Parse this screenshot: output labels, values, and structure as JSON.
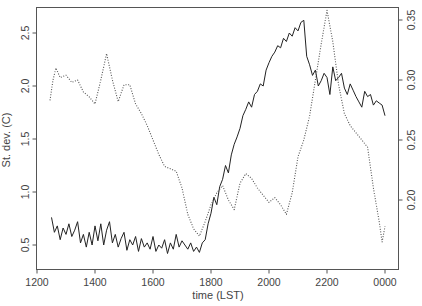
{
  "chart_data": {
    "type": "line",
    "title": "",
    "xlabel": "time (LST)",
    "ylabel": "St. dev. (C)",
    "ylabel_right": "",
    "x_tick_labels": [
      "1200",
      "1400",
      "1600",
      "1800",
      "2000",
      "2200",
      "0000"
    ],
    "y_ticks_left": [
      0.5,
      1.0,
      1.5,
      2.0,
      2.5
    ],
    "y_tick_labels_left": [
      "0.5",
      "1.0",
      "1.5",
      "2.0",
      "2.5"
    ],
    "y_ticks_right": [
      0.2,
      0.25,
      0.3,
      0.35
    ],
    "y_tick_labels_right": [
      "0.20",
      "0.25",
      "0.30",
      "0.35"
    ],
    "xlim_hours_after_noon": [
      0,
      12.45
    ],
    "ylim_left": [
      0.26,
      2.76
    ],
    "ylim_right": [
      0.143,
      0.361
    ],
    "grid": false,
    "legend": "none",
    "series": [
      {
        "name": "St. dev. (solid, left axis)",
        "style": "solid",
        "axis": "left",
        "x_hours": [
          0.5,
          0.6,
          0.7,
          0.8,
          0.9,
          1.0,
          1.1,
          1.2,
          1.3,
          1.4,
          1.5,
          1.6,
          1.7,
          1.8,
          1.9,
          2.0,
          2.1,
          2.2,
          2.3,
          2.4,
          2.5,
          2.6,
          2.7,
          2.8,
          2.9,
          3.0,
          3.1,
          3.2,
          3.3,
          3.4,
          3.5,
          3.6,
          3.7,
          3.8,
          3.9,
          4.0,
          4.1,
          4.2,
          4.3,
          4.4,
          4.5,
          4.6,
          4.7,
          4.8,
          4.9,
          5.0,
          5.1,
          5.2,
          5.3,
          5.4,
          5.5,
          5.6,
          5.7,
          5.8,
          5.9,
          6.0,
          6.1,
          6.2,
          6.3,
          6.4,
          6.5,
          6.6,
          6.7,
          6.8,
          6.9,
          7.0,
          7.1,
          7.2,
          7.3,
          7.4,
          7.5,
          7.6,
          7.7,
          7.8,
          7.9,
          8.0,
          8.1,
          8.2,
          8.3,
          8.4,
          8.5,
          8.6,
          8.7,
          8.8,
          8.9,
          9.0,
          9.1,
          9.2,
          9.3,
          9.4,
          9.5,
          9.6,
          9.7,
          9.8,
          9.9,
          10.0,
          10.1,
          10.2,
          10.3,
          10.4,
          10.5,
          10.6,
          10.7,
          10.8,
          10.9,
          11.0,
          11.1,
          11.2,
          11.3,
          11.4,
          11.5,
          11.6,
          11.7,
          11.8,
          11.9,
          12.0
        ],
        "values": [
          0.76,
          0.62,
          0.68,
          0.55,
          0.66,
          0.6,
          0.7,
          0.58,
          0.64,
          0.72,
          0.52,
          0.6,
          0.48,
          0.62,
          0.5,
          0.68,
          0.54,
          0.7,
          0.5,
          0.64,
          0.72,
          0.52,
          0.6,
          0.48,
          0.56,
          0.62,
          0.45,
          0.55,
          0.5,
          0.58,
          0.44,
          0.56,
          0.48,
          0.52,
          0.46,
          0.58,
          0.44,
          0.5,
          0.47,
          0.55,
          0.42,
          0.52,
          0.46,
          0.6,
          0.48,
          0.54,
          0.5,
          0.46,
          0.52,
          0.44,
          0.48,
          0.43,
          0.52,
          0.55,
          0.7,
          0.8,
          0.95,
          0.88,
          1.05,
          1.12,
          1.25,
          1.18,
          1.35,
          1.45,
          1.52,
          1.6,
          1.72,
          1.78,
          1.85,
          1.8,
          1.92,
          1.95,
          2.02,
          2.0,
          2.15,
          2.22,
          2.28,
          2.32,
          2.38,
          2.36,
          2.45,
          2.42,
          2.5,
          2.47,
          2.55,
          2.52,
          2.6,
          2.62,
          2.28,
          2.2,
          2.1,
          2.15,
          2.0,
          2.05,
          2.12,
          2.08,
          1.92,
          2.18,
          2.05,
          2.08,
          2.12,
          1.98,
          1.92,
          2.02,
          1.96,
          1.9,
          1.85,
          1.8,
          1.95,
          1.9,
          1.92,
          1.82,
          1.86,
          1.84,
          1.82,
          1.72
        ],
        "color": "#222222"
      },
      {
        "name": "Dotted series (right axis)",
        "style": "dotted",
        "axis": "right",
        "x_hours": [
          0.45,
          0.55,
          0.65,
          0.8,
          1.0,
          1.2,
          1.4,
          1.6,
          1.8,
          2.0,
          2.2,
          2.4,
          2.6,
          2.8,
          3.0,
          3.2,
          3.4,
          3.6,
          3.8,
          4.0,
          4.2,
          4.4,
          4.6,
          4.8,
          5.0,
          5.2,
          5.4,
          5.6,
          5.8,
          6.0,
          6.2,
          6.4,
          6.6,
          6.8,
          7.0,
          7.2,
          7.4,
          7.6,
          7.8,
          8.0,
          8.2,
          8.4,
          8.6,
          8.8,
          9.0,
          9.2,
          9.4,
          9.6,
          9.8,
          10.0,
          10.2,
          10.4,
          10.6,
          10.8,
          11.0,
          11.2,
          11.4,
          11.6,
          11.8,
          11.9,
          12.0
        ],
        "values": [
          0.283,
          0.3,
          0.31,
          0.302,
          0.304,
          0.298,
          0.3,
          0.29,
          0.286,
          0.28,
          0.3,
          0.322,
          0.3,
          0.282,
          0.296,
          0.296,
          0.28,
          0.272,
          0.262,
          0.25,
          0.238,
          0.228,
          0.226,
          0.224,
          0.21,
          0.188,
          0.176,
          0.17,
          0.182,
          0.196,
          0.206,
          0.212,
          0.2,
          0.192,
          0.214,
          0.222,
          0.218,
          0.21,
          0.204,
          0.198,
          0.202,
          0.196,
          0.188,
          0.206,
          0.236,
          0.25,
          0.27,
          0.3,
          0.33,
          0.358,
          0.332,
          0.296,
          0.272,
          0.262,
          0.256,
          0.25,
          0.244,
          0.21,
          0.182,
          0.165,
          0.178
        ],
        "color": "#555555"
      }
    ]
  }
}
